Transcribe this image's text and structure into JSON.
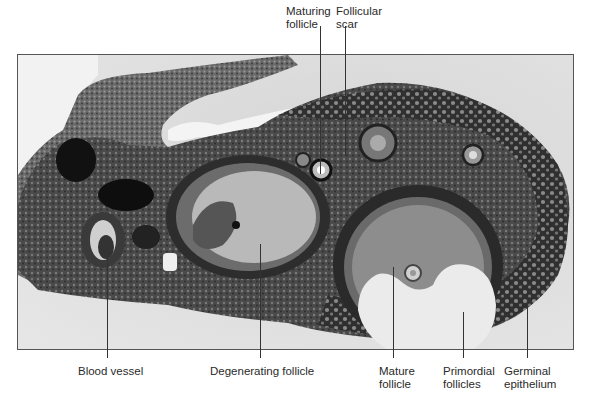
{
  "figure": {
    "labels_top": [
      {
        "id": "maturing-follicle",
        "line1": "Maturing",
        "line2": "follicle"
      },
      {
        "id": "follicular-scar",
        "line1": "Follicular",
        "line2": "scar"
      }
    ],
    "labels_bottom": [
      {
        "id": "blood-vessel",
        "line1": "Blood vessel",
        "line2": ""
      },
      {
        "id": "degenerating-follicle",
        "line1": "Degenerating follicle",
        "line2": ""
      },
      {
        "id": "mature-follicle",
        "line1": "Mature",
        "line2": "follicle"
      },
      {
        "id": "primordial-follicles",
        "line1": "Primordial",
        "line2": "follicles"
      },
      {
        "id": "germinal-epithelium",
        "line1": "Germinal",
        "line2": "epithelium"
      }
    ]
  },
  "colors": {
    "background": "#d8d8d8",
    "tissue_dark": "#2a2a2a",
    "tissue_mid": "#5a5a5a",
    "follicle_fluid": "#c8c8c8",
    "frame_border": "#555555"
  }
}
